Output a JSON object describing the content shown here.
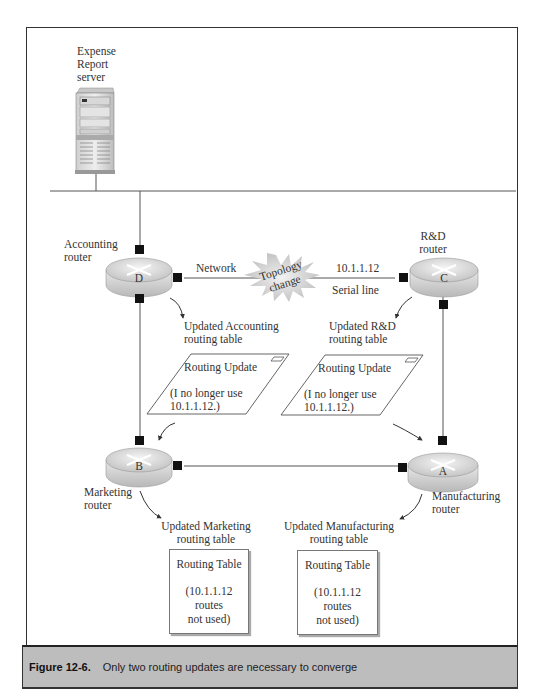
{
  "figure": {
    "caption_label": "Figure 12-6.",
    "caption_text": "Only two routing updates are necessary to converge"
  },
  "server": {
    "label_lines": [
      "Expense",
      "Report",
      "server"
    ]
  },
  "routers": {
    "accounting": {
      "letter": "D",
      "label_lines": [
        "Accounting",
        "router"
      ]
    },
    "rnd": {
      "letter": "C",
      "label_lines": [
        "R&D",
        "router"
      ]
    },
    "marketing": {
      "letter": "B",
      "label_lines": [
        "Marketing",
        "router"
      ]
    },
    "manufacturing": {
      "letter": "A",
      "label_lines": [
        "Manufacturing",
        "router"
      ]
    }
  },
  "links": {
    "network_label": "Network",
    "topology_change_lines": [
      "Topology",
      "change"
    ],
    "ip_label": "10.1.1.12",
    "serial_label": "Serial line"
  },
  "updated_tables": {
    "accounting": [
      "Updated Accounting",
      "routing table"
    ],
    "rnd": [
      "Updated R&D",
      "routing table"
    ],
    "marketing": [
      "Updated Marketing",
      "routing table"
    ],
    "manufacturing": [
      "Updated Manufacturing",
      "routing table"
    ]
  },
  "routing_updates": [
    {
      "title": "Routing Update",
      "body_lines": [
        "(I no longer use",
        "10.1.1.12.)"
      ]
    },
    {
      "title": "Routing Update",
      "body_lines": [
        "(I no longer use",
        "10.1.1.12.)"
      ]
    }
  ],
  "routing_tables": [
    {
      "title": "Routing Table",
      "body_lines": [
        "(10.1.1.12",
        "routes",
        "not used)"
      ]
    },
    {
      "title": "Routing Table",
      "body_lines": [
        "(10.1.1.12",
        "routes",
        "not used)"
      ]
    }
  ]
}
